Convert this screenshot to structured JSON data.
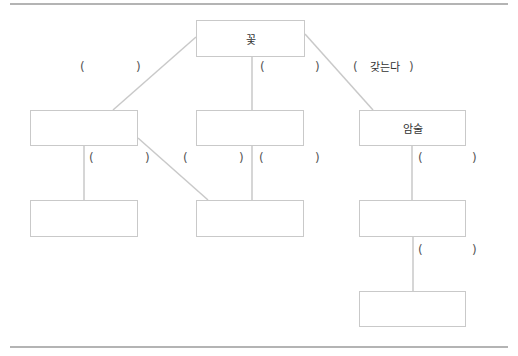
{
  "diagram": {
    "nodes": {
      "top": {
        "label": "꽃"
      },
      "mid_left": {
        "label": ""
      },
      "mid_center": {
        "label": ""
      },
      "mid_right": {
        "label": "암술"
      },
      "low_left": {
        "label": ""
      },
      "low_center": {
        "label": ""
      },
      "low_right": {
        "label": ""
      },
      "bottom_right": {
        "label": ""
      }
    },
    "edges": [
      {
        "from": "top",
        "to": "mid_left",
        "label": ""
      },
      {
        "from": "top",
        "to": "mid_center",
        "label": ""
      },
      {
        "from": "top",
        "to": "mid_right",
        "label": "갖는다"
      },
      {
        "from": "mid_left",
        "to": "low_left",
        "label": ""
      },
      {
        "from": "mid_left",
        "to": "low_center",
        "label": ""
      },
      {
        "from": "mid_center",
        "to": "low_center",
        "label": ""
      },
      {
        "from": "mid_right",
        "to": "low_right",
        "label": ""
      },
      {
        "from": "low_right",
        "to": "bottom_right",
        "label": ""
      }
    ],
    "paren_open": "(",
    "paren_close": ")"
  },
  "colors": {
    "line": "#c9c9c9",
    "rule": "#b4b4b4",
    "text": "#333333"
  }
}
